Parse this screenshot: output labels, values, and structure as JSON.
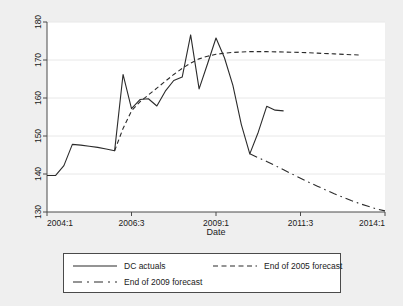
{
  "chart_data": {
    "type": "line",
    "title": "",
    "subtitle": "",
    "xlabel": "Date",
    "ylabel": "",
    "grid": true,
    "legend_position": "bottom",
    "ylim": [
      130,
      180
    ],
    "yticks": [
      130,
      140,
      150,
      160,
      170,
      180
    ],
    "ytick_labels": [
      "130",
      "140",
      "150",
      "160",
      "170",
      "180"
    ],
    "xlim_quarters": [
      0,
      40
    ],
    "xticks_quarters": [
      0,
      10,
      20,
      30,
      40
    ],
    "xtick_labels": [
      "2004:1",
      "2006:3",
      "2009:1",
      "2011:3",
      "2014:1"
    ],
    "x_unit": "quarter index from 2004:1",
    "series": [
      {
        "name": "DC actuals",
        "style": "solid",
        "color": "#2b2b2b",
        "x": [
          0,
          1,
          2,
          3,
          4,
          5,
          6,
          7,
          8,
          9,
          10,
          11,
          12,
          13,
          14,
          15,
          16,
          17,
          18,
          19,
          20,
          21,
          22,
          23,
          24,
          25,
          26,
          27,
          28
        ],
        "values": [
          139.6,
          139.6,
          142.2,
          147.8,
          147.6,
          147.3,
          147.0,
          146.6,
          146.1,
          166.2,
          157.2,
          159.6,
          159.8,
          157.9,
          161.8,
          164.6,
          165.5,
          176.6,
          162.4,
          169.0,
          175.8,
          170.6,
          163.3,
          153.0,
          145.3,
          151.0,
          157.8,
          156.8,
          156.6
        ]
      },
      {
        "name": "End of 2005 forecast",
        "style": "dashed",
        "color": "#2b2b2b",
        "x": [
          8,
          9,
          10,
          11,
          12,
          13,
          14,
          15,
          16,
          17,
          18,
          19,
          20,
          21,
          22,
          23,
          24,
          26,
          28,
          30,
          32,
          34,
          36,
          37
        ],
        "values": [
          146.1,
          152.0,
          156.6,
          159.0,
          160.8,
          162.6,
          164.4,
          166.2,
          167.8,
          169.2,
          170.3,
          171.0,
          171.5,
          171.8,
          172.0,
          172.1,
          172.2,
          172.2,
          172.1,
          172.0,
          171.8,
          171.6,
          171.4,
          171.3
        ]
      },
      {
        "name": "End of 2009 forecast",
        "style": "longdash",
        "color": "#2b2b2b",
        "x": [
          24,
          25,
          26,
          27,
          28,
          29,
          30,
          31,
          32,
          33,
          34,
          35,
          36,
          37,
          38,
          39,
          40
        ],
        "values": [
          145.3,
          144.3,
          143.3,
          142.2,
          141.1,
          140.0,
          138.9,
          137.8,
          136.8,
          135.8,
          134.8,
          133.9,
          133.0,
          132.2,
          131.5,
          130.8,
          130.3
        ]
      }
    ]
  },
  "legend": {
    "entries": [
      {
        "label": "DC actuals",
        "style": "solid"
      },
      {
        "label": "End of 2005 forecast",
        "style": "dashed"
      },
      {
        "label": "End of 2009 forecast",
        "style": "longdash"
      }
    ]
  },
  "colors": {
    "canvas": "#efefef",
    "plot_background": "#ffffff",
    "line": "#2b2b2b",
    "grid": "#e8e8e8",
    "frame": "#4a4a4a"
  }
}
